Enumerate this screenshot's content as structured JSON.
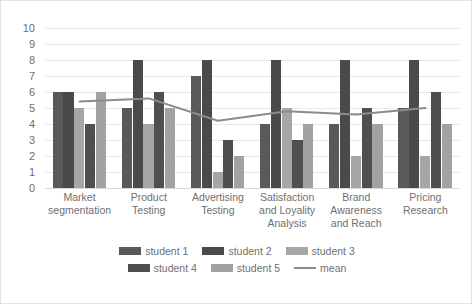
{
  "chart_data": {
    "type": "bar",
    "title": "",
    "subtitle": "",
    "xlabel": "",
    "ylabel": "",
    "ylim": [
      0,
      10
    ],
    "ytick_step": 1,
    "yticks": [
      10,
      9,
      8,
      7,
      6,
      5,
      4,
      3,
      2,
      1,
      0
    ],
    "grid": true,
    "legend_position": "bottom",
    "categories": [
      "Market segmentation",
      "Product Testing",
      "Advertising Testing",
      "Satisfaction and Loyality Analysis",
      "Brand Awareness and Reach",
      "Pricing Research"
    ],
    "category_lines": [
      [
        "Market",
        "segmentation"
      ],
      [
        "Product",
        "Testing"
      ],
      [
        "Advertising",
        "Testing"
      ],
      [
        "Satisfaction",
        "and Loyality",
        "Analysis"
      ],
      [
        "Brand",
        "Awareness",
        "and Reach"
      ],
      [
        "Pricing",
        "Research"
      ]
    ],
    "series": [
      {
        "name": "student 1",
        "type": "bar",
        "color": "#595959",
        "values": [
          6,
          5,
          7,
          4,
          4,
          5
        ]
      },
      {
        "name": "student 2",
        "type": "bar",
        "color": "#4a4a4a",
        "values": [
          6,
          8,
          8,
          8,
          8,
          8
        ]
      },
      {
        "name": "student 3",
        "type": "bar",
        "color": "#a6a6a6",
        "values": [
          5,
          4,
          1,
          5,
          2,
          2
        ]
      },
      {
        "name": "student 4",
        "type": "bar",
        "color": "#4f4f4f",
        "values": [
          4,
          6,
          3,
          3,
          5,
          6
        ]
      },
      {
        "name": "student 5",
        "type": "bar",
        "color": "#a2a2a2",
        "values": [
          6,
          5,
          2,
          4,
          4,
          4
        ]
      },
      {
        "name": "mean",
        "type": "line",
        "color": "#8c8c8c",
        "values": [
          5.4,
          5.6,
          4.2,
          4.8,
          4.6,
          5.0
        ]
      }
    ]
  },
  "legend": {
    "rows": [
      [
        "student 1",
        "student 2",
        "student 3"
      ],
      [
        "student 4",
        "student 5",
        "mean"
      ]
    ]
  }
}
